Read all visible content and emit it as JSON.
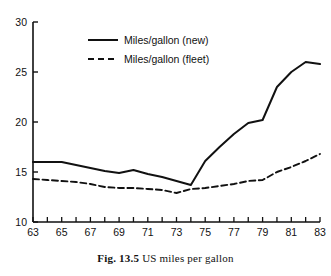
{
  "figure": {
    "caption_prefix": "Fig. 13.5",
    "caption_text": "US miles per gallon"
  },
  "axes": {
    "y_ticks": [
      "10",
      "15",
      "20",
      "25",
      "30"
    ],
    "x_ticks": [
      "63",
      "65",
      "67",
      "69",
      "71",
      "73",
      "75",
      "77",
      "79",
      "81",
      "83"
    ]
  },
  "legend": {
    "items": [
      {
        "label": "Miles/gallon (new)",
        "style": "solid"
      },
      {
        "label": "Miles/gallon (fleet)",
        "style": "dashed"
      }
    ]
  },
  "chart_data": {
    "type": "line",
    "title": "US miles per gallon",
    "xlabel": "",
    "ylabel": "",
    "xlim": [
      63,
      83
    ],
    "ylim": [
      10,
      30
    ],
    "grid": false,
    "legend_position": "top-center",
    "x": [
      63,
      64,
      65,
      66,
      67,
      68,
      69,
      70,
      71,
      72,
      73,
      74,
      75,
      76,
      77,
      78,
      79,
      80,
      81,
      82,
      83
    ],
    "x_tick_values": [
      63,
      65,
      67,
      69,
      71,
      73,
      75,
      77,
      79,
      81,
      83
    ],
    "y_tick_values": [
      10,
      15,
      20,
      25,
      30
    ],
    "series": [
      {
        "name": "Miles/gallon (new)",
        "style": "solid",
        "color": "#111111",
        "values": [
          16.0,
          16.0,
          16.0,
          15.7,
          15.4,
          15.1,
          14.9,
          15.2,
          14.8,
          14.5,
          14.1,
          13.7,
          16.1,
          17.5,
          18.8,
          19.9,
          20.2,
          23.5,
          25.0,
          26.0,
          25.8
        ]
      },
      {
        "name": "Miles/gallon (fleet)",
        "style": "dashed",
        "color": "#111111",
        "values": [
          14.3,
          14.2,
          14.1,
          14.0,
          13.8,
          13.5,
          13.4,
          13.4,
          13.3,
          13.2,
          12.9,
          13.3,
          13.4,
          13.6,
          13.8,
          14.1,
          14.2,
          15.0,
          15.5,
          16.1,
          16.8
        ]
      }
    ]
  }
}
